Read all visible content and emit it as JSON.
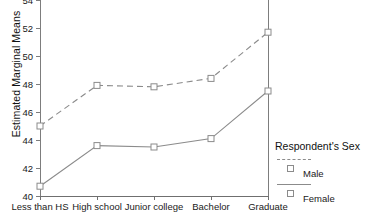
{
  "chart_data": {
    "type": "line",
    "title": "",
    "xlabel": "",
    "ylabel": "Estimated Marginal Means",
    "categories": [
      "Less than HS",
      "High school",
      "Junior college",
      "Bachelor",
      "Graduate"
    ],
    "series": [
      {
        "name": "Male",
        "values": [
          45.0,
          47.9,
          47.8,
          48.4,
          51.7
        ],
        "linestyle": "dashed",
        "marker": "square",
        "color": "#8b8b8b"
      },
      {
        "name": "Female",
        "values": [
          40.7,
          43.6,
          43.5,
          44.1,
          47.5
        ],
        "linestyle": "solid",
        "marker": "square",
        "color": "#8b8b8b"
      }
    ],
    "ylim": [
      40,
      54
    ],
    "yticks": [
      40,
      42,
      44,
      46,
      48,
      50,
      52,
      54
    ],
    "ytick_labels": [
      "40",
      "42",
      "44",
      "46",
      "48",
      "50",
      "52",
      "54"
    ],
    "grid": false,
    "legend_position": "right",
    "legend_title": "Respondent's Sex"
  },
  "legend": {
    "title": "Respondent's Sex",
    "entries": [
      {
        "label": "Male"
      },
      {
        "label": "Female"
      }
    ]
  },
  "axes": {
    "y_title": "Estimated Marginal Means"
  }
}
